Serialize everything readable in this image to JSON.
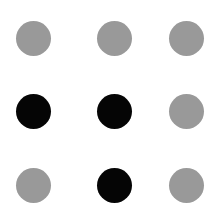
{
  "grid": {
    "rows": 3,
    "cols": 3,
    "dot_diameter": 35,
    "col_centers": [
      33,
      114,
      186
    ],
    "row_centers": [
      38,
      111,
      185
    ],
    "colors": {
      "gray": "#999999",
      "black": "#050505"
    },
    "dots": [
      {
        "row": 0,
        "col": 0,
        "color": "gray"
      },
      {
        "row": 0,
        "col": 1,
        "color": "gray"
      },
      {
        "row": 0,
        "col": 2,
        "color": "gray"
      },
      {
        "row": 1,
        "col": 0,
        "color": "black"
      },
      {
        "row": 1,
        "col": 1,
        "color": "black"
      },
      {
        "row": 1,
        "col": 2,
        "color": "gray"
      },
      {
        "row": 2,
        "col": 0,
        "color": "gray"
      },
      {
        "row": 2,
        "col": 1,
        "color": "black"
      },
      {
        "row": 2,
        "col": 2,
        "color": "gray"
      }
    ]
  }
}
